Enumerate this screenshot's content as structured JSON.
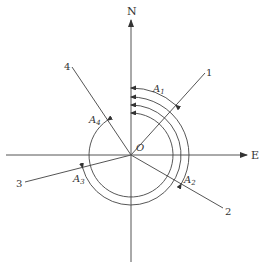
{
  "diagram": {
    "type": "azimuth-bearing-diagram",
    "origin": {
      "label": "O"
    },
    "axes": {
      "north": {
        "label": "N"
      },
      "east": {
        "label": "E"
      }
    },
    "lines": [
      {
        "id": "1",
        "label": "1",
        "bearing_deg": 42
      },
      {
        "id": "2",
        "label": "2",
        "bearing_deg": 120
      },
      {
        "id": "3",
        "label": "3",
        "bearing_deg": 255
      },
      {
        "id": "4",
        "label": "4",
        "bearing_deg": 326
      }
    ],
    "angles": [
      {
        "label": "A",
        "subscript": "1",
        "to_line": "1"
      },
      {
        "label": "A",
        "subscript": "2",
        "to_line": "2"
      },
      {
        "label": "A",
        "subscript": "3",
        "to_line": "3"
      },
      {
        "label": "A",
        "subscript": "4",
        "to_line": "4"
      }
    ],
    "colors": {
      "line": "#444444",
      "text": "#333333",
      "background": "#ffffff"
    }
  }
}
